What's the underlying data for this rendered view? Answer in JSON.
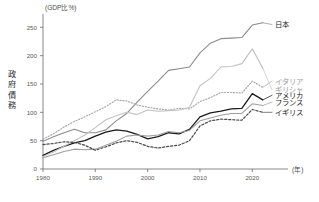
{
  "chart_data": {
    "type": "line",
    "title": "",
    "unit_label": "(GDP比%)",
    "ylabel": "政府債務",
    "xlabel": "(年)",
    "xlim": [
      1980,
      2023
    ],
    "ylim": [
      0,
      270
    ],
    "yticks": [
      0,
      50,
      100,
      150,
      200,
      250
    ],
    "xticks": [
      1980,
      1990,
      2000,
      2010,
      2020
    ],
    "grid": false,
    "legend_position": "inline-right",
    "x": [
      1980,
      1982,
      1984,
      1986,
      1988,
      1990,
      1992,
      1994,
      1996,
      1998,
      2000,
      2002,
      2004,
      2006,
      2008,
      2010,
      2012,
      2014,
      2016,
      2018,
      2020,
      2022
    ],
    "series": [
      {
        "name": "日本",
        "color": "#8c8c8c",
        "style": "solid",
        "width": 1.1,
        "label_y": 255,
        "values": [
          49,
          57,
          64,
          70,
          64,
          64,
          69,
          85,
          98,
          118,
          137,
          155,
          174,
          177,
          180,
          205,
          222,
          230,
          231,
          232,
          254,
          258
        ]
      },
      {
        "name": "アメリカ",
        "color": "#1b1b1b",
        "style": "solid",
        "width": 1.3,
        "label_y": 130,
        "values": [
          24,
          33,
          40,
          46,
          50,
          58,
          65,
          69,
          67,
          61,
          53,
          57,
          64,
          62,
          70,
          92,
          99,
          102,
          106,
          107,
          133,
          122
        ]
      },
      {
        "name": "イタリア",
        "color": "#a8a8a8",
        "style": "dotted",
        "width": 1.2,
        "label_y": 155,
        "values": [
          53,
          62,
          74,
          84,
          92,
          101,
          110,
          122,
          120,
          113,
          109,
          106,
          104,
          107,
          106,
          119,
          126,
          135,
          135,
          134,
          155,
          144
        ]
      },
      {
        "name": "ギリシャ",
        "color": "#c2c2c2",
        "style": "solid",
        "width": 1.1,
        "label_y": 140,
        "values": [
          22,
          30,
          40,
          50,
          60,
          73,
          87,
          94,
          100,
          96,
          104,
          102,
          103,
          104,
          109,
          147,
          160,
          180,
          181,
          186,
          212,
          178
        ]
      },
      {
        "name": "フランス",
        "color": "#9e9e9e",
        "style": "solid",
        "width": 1.1,
        "label_y": 118,
        "values": [
          20,
          25,
          31,
          35,
          34,
          35,
          42,
          49,
          58,
          60,
          58,
          60,
          66,
          64,
          68,
          85,
          90,
          95,
          98,
          98,
          115,
          112
        ]
      },
      {
        "name": "イギリス",
        "color": "#4a4a4a",
        "style": "dashed",
        "width": 1.2,
        "label_y": 100,
        "values": [
          43,
          45,
          48,
          47,
          42,
          33,
          39,
          46,
          50,
          47,
          40,
          37,
          40,
          42,
          50,
          76,
          85,
          88,
          87,
          86,
          105,
          100
        ]
      }
    ]
  }
}
